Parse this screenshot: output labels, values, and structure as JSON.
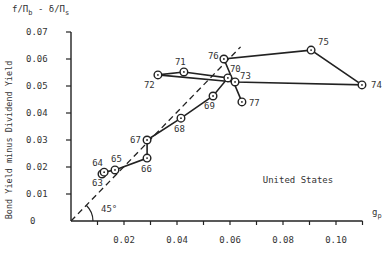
{
  "chart_data": {
    "type": "line",
    "xlabel": "g_p",
    "ylabel": "Bond Yield minus Dividend Yield",
    "annotation": "United States",
    "angle_label": "45°",
    "reference_line": "45-degree dashed line from origin",
    "xlim": [
      0,
      0.11
    ],
    "ylim": [
      0,
      0.07
    ],
    "x_ticks": [
      0.01,
      0.02,
      0.03,
      0.04,
      0.05,
      0.06,
      0.07,
      0.08,
      0.09,
      0.1,
      0.11
    ],
    "x_tick_labels": [
      "0.02",
      "0.04",
      "0.06",
      "0.08",
      "0.10"
    ],
    "y_tick_labels": [
      "0",
      "0.01",
      "0.02",
      "0.03",
      "0.04",
      "0.05",
      "0.06",
      "0.07"
    ],
    "grid": false,
    "points": [
      {
        "label": "63",
        "x": 0.0117,
        "y": 0.0174
      },
      {
        "label": "64",
        "x": 0.0125,
        "y": 0.0181
      },
      {
        "label": "65",
        "x": 0.0166,
        "y": 0.0189
      },
      {
        "label": "66",
        "x": 0.0287,
        "y": 0.0233
      },
      {
        "label": "67",
        "x": 0.0287,
        "y": 0.03
      },
      {
        "label": "68",
        "x": 0.0415,
        "y": 0.0381
      },
      {
        "label": "69",
        "x": 0.0536,
        "y": 0.0463
      },
      {
        "label": "70",
        "x": 0.0592,
        "y": 0.053
      },
      {
        "label": "71",
        "x": 0.0426,
        "y": 0.0552
      },
      {
        "label": "72",
        "x": 0.0328,
        "y": 0.0541
      },
      {
        "label": "73",
        "x": 0.0619,
        "y": 0.0515
      },
      {
        "label": "74",
        "x": 0.1098,
        "y": 0.0504
      },
      {
        "label": "75",
        "x": 0.0906,
        "y": 0.0633
      },
      {
        "label": "76",
        "x": 0.0577,
        "y": 0.06
      },
      {
        "label": "77",
        "x": 0.0645,
        "y": 0.0441
      }
    ]
  },
  "labels": {
    "xlabel": "g_p",
    "ylabel": "Bond Yield minus Dividend Yield",
    "annotation": "United States",
    "angle": "45°"
  }
}
